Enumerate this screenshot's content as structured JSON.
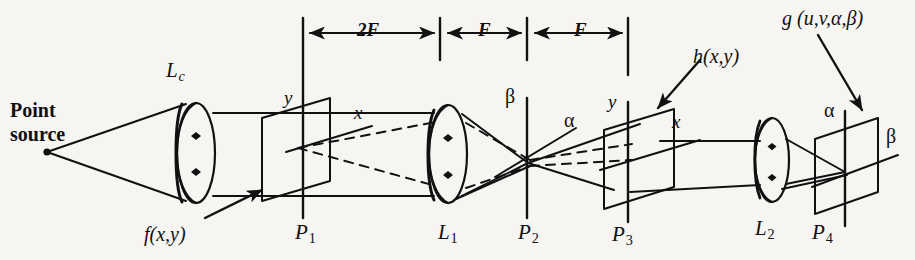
{
  "figure": {
    "kind": "optical-system-diagram",
    "background_color": "#f6f5f2",
    "ink_color": "#111111",
    "width": 915,
    "height": 260
  },
  "source": {
    "label_line1": "Point",
    "label_line2": "source"
  },
  "lenses": [
    {
      "id": "Lc",
      "base": "L",
      "sub": "c",
      "name": "collimating-lens"
    },
    {
      "id": "L1",
      "base": "L",
      "sub": "1",
      "name": "fourier-transform-lens-1"
    },
    {
      "id": "L2",
      "base": "L",
      "sub": "2",
      "name": "fourier-transform-lens-2"
    }
  ],
  "planes": [
    {
      "id": "P1",
      "base": "P",
      "sub": "1",
      "axis_vertical": "y",
      "axis_diagonal": "x"
    },
    {
      "id": "P2",
      "base": "P",
      "sub": "2",
      "axis_vertical": "β",
      "axis_diagonal": "α"
    },
    {
      "id": "P3",
      "base": "P",
      "sub": "3",
      "axis_vertical": "y",
      "axis_diagonal": "x"
    },
    {
      "id": "P4",
      "base": "P",
      "sub": "4",
      "axis_vertical": "α",
      "axis_diagonal": "β"
    }
  ],
  "functions": {
    "input": "f(x,y)",
    "filter": "h(x,y)",
    "output": "g (u,v,α,β)"
  },
  "dimensions": [
    {
      "label": "2F",
      "from_plane": "P1",
      "to_plane": "L1"
    },
    {
      "label": "F",
      "from_plane": "L1",
      "to_plane": "P2"
    },
    {
      "label": "F",
      "from_plane": "P2",
      "to_plane": "P3"
    }
  ]
}
